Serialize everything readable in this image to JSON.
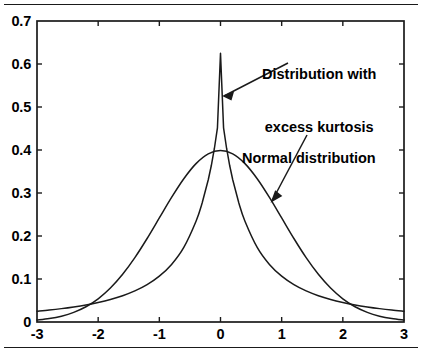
{
  "figure": {
    "background_color": "#ffffff",
    "line_color": "#1a1a1a",
    "text_color": "#000000",
    "top_rule": "horizontal-rule",
    "bottom_rule": "horizontal-rule"
  },
  "chart_data": {
    "type": "line",
    "title": "",
    "xlabel": "",
    "ylabel": "",
    "xlim": [
      -3,
      3
    ],
    "ylim": [
      0,
      0.7
    ],
    "xticks": [
      -3,
      -2,
      -1,
      0,
      1,
      2,
      3
    ],
    "yticks": [
      0,
      0.1,
      0.2,
      0.3,
      0.4,
      0.5,
      0.6,
      0.7
    ],
    "xtick_labels": [
      "-3",
      "-2",
      "-1",
      "0",
      "1",
      "2",
      "3"
    ],
    "ytick_labels": [
      "0",
      "0.1",
      "0.2",
      "0.3",
      "0.4",
      "0.5",
      "0.6",
      "0.7"
    ],
    "grid": false,
    "legend": "none",
    "tick_direction": "in",
    "box": true,
    "series": [
      {
        "name": "Normal distribution",
        "peak_value": 0.4,
        "peak_x": 0,
        "x": [
          -3,
          -2.8,
          -2.6,
          -2.4,
          -2.2,
          -2,
          -1.8,
          -1.6,
          -1.4,
          -1.2,
          -1,
          -0.8,
          -0.6,
          -0.4,
          -0.2,
          0,
          0.2,
          0.4,
          0.6,
          0.8,
          1,
          1.2,
          1.4,
          1.6,
          1.8,
          2,
          2.2,
          2.4,
          2.6,
          2.8,
          3
        ],
        "values": [
          0.0044,
          0.0079,
          0.0136,
          0.0224,
          0.0355,
          0.054,
          0.079,
          0.1109,
          0.1497,
          0.1942,
          0.242,
          0.2897,
          0.3332,
          0.3683,
          0.391,
          0.3989,
          0.391,
          0.3683,
          0.3332,
          0.2897,
          0.242,
          0.1942,
          0.1497,
          0.1109,
          0.079,
          0.054,
          0.0355,
          0.0224,
          0.0136,
          0.0079,
          0.0044
        ]
      },
      {
        "name": "Distribution with excess kurtosis",
        "peak_value": 0.625,
        "peak_x": 0,
        "tail_value_at_3": 0.025,
        "x": [
          -3,
          -2.8,
          -2.6,
          -2.4,
          -2.2,
          -2,
          -1.8,
          -1.6,
          -1.4,
          -1.2,
          -1,
          -0.8,
          -0.6,
          -0.4,
          -0.3,
          -0.2,
          -0.15,
          -0.1,
          -0.05,
          0,
          0.05,
          0.1,
          0.15,
          0.2,
          0.3,
          0.4,
          0.6,
          0.8,
          1,
          1.2,
          1.4,
          1.6,
          1.8,
          2,
          2.2,
          2.4,
          2.6,
          2.8,
          3
        ],
        "values": [
          0.0249,
          0.0277,
          0.0311,
          0.0351,
          0.0398,
          0.0455,
          0.0525,
          0.0612,
          0.0723,
          0.0869,
          0.1065,
          0.1338,
          0.1735,
          0.2344,
          0.2768,
          0.3308,
          0.3639,
          0.4035,
          0.4517,
          0.625,
          0.4517,
          0.4035,
          0.3639,
          0.3308,
          0.2768,
          0.2344,
          0.1735,
          0.1338,
          0.1065,
          0.0869,
          0.0723,
          0.0612,
          0.0525,
          0.0455,
          0.0398,
          0.0351,
          0.0311,
          0.0277,
          0.0249
        ]
      }
    ],
    "annotations": [
      {
        "id": "kurtosis",
        "line1": "Distribution with",
        "line2": "excess kurtosis",
        "points_to_series": "Distribution with excess kurtosis"
      },
      {
        "id": "normal",
        "line1": "Normal distribution",
        "points_to_series": "Normal distribution"
      }
    ]
  }
}
